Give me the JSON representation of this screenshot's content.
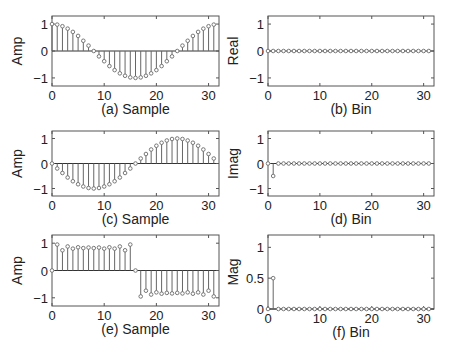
{
  "chart_data": [
    {
      "type": "stem",
      "panel": "a",
      "caption": "(a) Sample",
      "ylabel": "Amp",
      "xlim": [
        0,
        32
      ],
      "ylim": [
        -1.3,
        1.3
      ],
      "xticks": [
        "0",
        "10",
        "20",
        "30"
      ],
      "yticks": [
        "-1",
        "0",
        "1"
      ],
      "x": [
        0,
        1,
        2,
        3,
        4,
        5,
        6,
        7,
        8,
        9,
        10,
        11,
        12,
        13,
        14,
        15,
        16,
        17,
        18,
        19,
        20,
        21,
        22,
        23,
        24,
        25,
        26,
        27,
        28,
        29,
        30,
        31
      ],
      "values": [
        1.0,
        0.98,
        0.92,
        0.83,
        0.71,
        0.56,
        0.38,
        0.2,
        0.0,
        -0.2,
        -0.38,
        -0.56,
        -0.71,
        -0.83,
        -0.92,
        -0.98,
        -1.0,
        -0.98,
        -0.92,
        -0.83,
        -0.71,
        -0.56,
        -0.38,
        -0.2,
        0.0,
        0.2,
        0.38,
        0.56,
        0.71,
        0.83,
        0.92,
        0.98
      ]
    },
    {
      "type": "stem",
      "panel": "b",
      "caption": "(b) Bin",
      "ylabel": "Real",
      "xlim": [
        0,
        32
      ],
      "ylim": [
        -1.3,
        1.3
      ],
      "xticks": [
        "0",
        "10",
        "20",
        "30"
      ],
      "yticks": [
        "-1",
        "0",
        "1"
      ],
      "x": [
        0,
        1,
        2,
        3,
        4,
        5,
        6,
        7,
        8,
        9,
        10,
        11,
        12,
        13,
        14,
        15,
        16,
        17,
        18,
        19,
        20,
        21,
        22,
        23,
        24,
        25,
        26,
        27,
        28,
        29,
        30,
        31
      ],
      "values": [
        0,
        0,
        0,
        0,
        0,
        0,
        0,
        0,
        0,
        0,
        0,
        0,
        0,
        0,
        0,
        0,
        0,
        0,
        0,
        0,
        0,
        0,
        0,
        0,
        0,
        0,
        0,
        0,
        0,
        0,
        0,
        0
      ]
    },
    {
      "type": "stem",
      "panel": "c",
      "caption": "(c) Sample",
      "ylabel": "Amp",
      "xlim": [
        0,
        32
      ],
      "ylim": [
        -1.3,
        1.3
      ],
      "xticks": [
        "0",
        "10",
        "20",
        "30"
      ],
      "yticks": [
        "-1",
        "0",
        "1"
      ],
      "x": [
        0,
        1,
        2,
        3,
        4,
        5,
        6,
        7,
        8,
        9,
        10,
        11,
        12,
        13,
        14,
        15,
        16,
        17,
        18,
        19,
        20,
        21,
        22,
        23,
        24,
        25,
        26,
        27,
        28,
        29,
        30,
        31
      ],
      "values": [
        0.0,
        -0.2,
        -0.38,
        -0.56,
        -0.71,
        -0.83,
        -0.92,
        -0.98,
        -1.0,
        -0.98,
        -0.92,
        -0.83,
        -0.71,
        -0.56,
        -0.38,
        -0.2,
        0.0,
        0.2,
        0.38,
        0.56,
        0.71,
        0.83,
        0.92,
        0.98,
        1.0,
        0.98,
        0.92,
        0.83,
        0.71,
        0.56,
        0.38,
        0.2
      ]
    },
    {
      "type": "stem",
      "panel": "d",
      "caption": "(d) Bin",
      "ylabel": "Imag",
      "xlim": [
        0,
        32
      ],
      "ylim": [
        -1.3,
        1.3
      ],
      "xticks": [
        "0",
        "10",
        "20",
        "30"
      ],
      "yticks": [
        "-1",
        "0",
        "1"
      ],
      "x": [
        0,
        1,
        2,
        3,
        4,
        5,
        6,
        7,
        8,
        9,
        10,
        11,
        12,
        13,
        14,
        15,
        16,
        17,
        18,
        19,
        20,
        21,
        22,
        23,
        24,
        25,
        26,
        27,
        28,
        29,
        30,
        31
      ],
      "values": [
        0,
        -0.5,
        0,
        0,
        0,
        0,
        0,
        0,
        0,
        0,
        0,
        0,
        0,
        0,
        0,
        0,
        0,
        0,
        0,
        0,
        0,
        0,
        0,
        0,
        0,
        0,
        0,
        0,
        0,
        0,
        0,
        0
      ]
    },
    {
      "type": "stem",
      "panel": "e",
      "caption": "(e) Sample",
      "ylabel": "Amp",
      "xlim": [
        0,
        32
      ],
      "ylim": [
        -1.3,
        1.3
      ],
      "xticks": [
        "0",
        "10",
        "20",
        "30"
      ],
      "yticks": [
        "-1",
        "0",
        "1"
      ],
      "x": [
        0,
        1,
        2,
        3,
        4,
        5,
        6,
        7,
        8,
        9,
        10,
        11,
        12,
        13,
        14,
        15,
        16,
        17,
        18,
        19,
        20,
        21,
        22,
        23,
        24,
        25,
        26,
        27,
        28,
        29,
        30,
        31
      ],
      "values": [
        0.0,
        0.95,
        0.74,
        0.88,
        0.8,
        0.85,
        0.82,
        0.84,
        0.82,
        0.84,
        0.8,
        0.85,
        0.8,
        0.88,
        0.74,
        0.95,
        0.0,
        -0.95,
        -0.74,
        -0.88,
        -0.8,
        -0.85,
        -0.82,
        -0.84,
        -0.82,
        -0.84,
        -0.8,
        -0.85,
        -0.8,
        -0.88,
        -0.74,
        -0.95
      ]
    },
    {
      "type": "stem",
      "panel": "f",
      "caption": "(f) Bin",
      "ylabel": "Mag",
      "xlim": [
        0,
        32
      ],
      "ylim": [
        0,
        1.2
      ],
      "xticks": [
        "0",
        "10",
        "20",
        "30"
      ],
      "yticks": [
        "0",
        "0.5",
        "1"
      ],
      "x": [
        0,
        1,
        2,
        3,
        4,
        5,
        6,
        7,
        8,
        9,
        10,
        11,
        12,
        13,
        14,
        15,
        16,
        17,
        18,
        19,
        20,
        21,
        22,
        23,
        24,
        25,
        26,
        27,
        28,
        29,
        30,
        31
      ],
      "values": [
        0,
        0.5,
        0,
        0,
        0,
        0,
        0,
        0,
        0,
        0,
        0,
        0,
        0,
        0,
        0,
        0,
        0,
        0,
        0,
        0,
        0,
        0,
        0,
        0,
        0,
        0,
        0,
        0,
        0,
        0,
        0,
        0
      ]
    }
  ],
  "style": {
    "axis_color": "#555555",
    "stem_color": "#666666",
    "marker_color": "#777777",
    "text_color": "#222222"
  }
}
